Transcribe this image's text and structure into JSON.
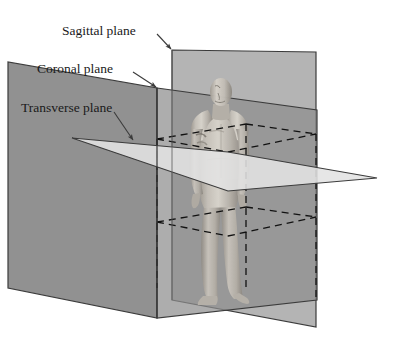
{
  "diagram": {
    "background_color": "#ffffff",
    "labels": {
      "sagittal": "Sagittal plane",
      "coronal": "Coronal plane",
      "transverse": "Transverse plane"
    },
    "planes": [
      {
        "id": "sagittal",
        "label": "Sagittal plane",
        "orientation": "vertical-longitudinal",
        "fill_color": "#b5b5b5",
        "stroke_color": "#3b3b3b"
      },
      {
        "id": "coronal",
        "label": "Coronal plane",
        "orientation": "vertical-frontal",
        "fill_color": "#8a8a8a",
        "stroke_color": "#3b3b3b"
      },
      {
        "id": "transverse",
        "label": "Transverse plane",
        "orientation": "horizontal",
        "fill_color": "#e0e0e0",
        "stroke_color": "#3b3b3b"
      }
    ],
    "figure": {
      "name": "human-body-model",
      "pose": "standing-anatomical-position",
      "facing": "anterior",
      "body_color": "#b9b4ad"
    },
    "hidden_edges": {
      "style": "dashed",
      "color": "#1a1a1a"
    },
    "leader_lines": {
      "color": "#3b3b3b",
      "arrowhead": true
    }
  }
}
